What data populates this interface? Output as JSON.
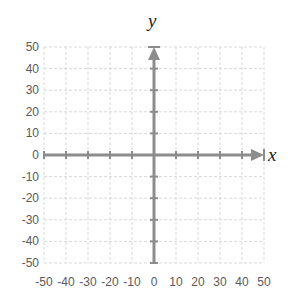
{
  "chart_data": {
    "type": "scatter",
    "title": "",
    "xlabel": "x",
    "ylabel": "y",
    "xlim": [
      -50,
      50
    ],
    "ylim": [
      -50,
      50
    ],
    "x_ticks": [
      -50,
      -40,
      -30,
      -20,
      -10,
      0,
      10,
      20,
      30,
      40,
      50
    ],
    "y_ticks": [
      50,
      40,
      30,
      20,
      10,
      0,
      -10,
      -20,
      -30,
      -40,
      -50
    ],
    "grid": true,
    "grid_style": "dashed",
    "series": [],
    "annotations": [
      "x-axis arrow pointing right",
      "y-axis arrow pointing up"
    ]
  },
  "colors": {
    "axis": "#8c8c8c",
    "grid": "#d9d9d9",
    "tick_label": "#595959"
  },
  "labels": {
    "x_var": "x",
    "y_var": "y"
  }
}
